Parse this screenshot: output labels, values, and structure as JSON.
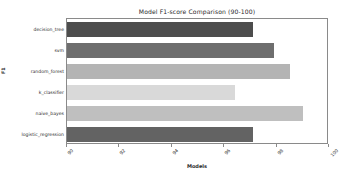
{
  "chart_data": {
    "type": "bar",
    "orientation": "horizontal",
    "title": "Model F1-score Comparison (90-100)",
    "xlabel": "Models",
    "ylabel": "F1",
    "categories": [
      "decision_tree",
      "svm",
      "random_forest",
      "k_classifier",
      "naive_bayes",
      "logistic_regression"
    ],
    "values": [
      97.1,
      97.9,
      98.5,
      96.4,
      99.0,
      97.1
    ],
    "bar_colors": [
      "#4d4d4d",
      "#6e6e6e",
      "#b4b4b4",
      "#d9d9d9",
      "#bfbfbf",
      "#636363"
    ],
    "xlim": [
      90,
      100
    ],
    "ylim": [
      0,
      6
    ],
    "xticks": [
      90,
      92,
      94,
      96,
      98,
      100
    ],
    "xtick_labels": [
      "90",
      "92",
      "94",
      "96",
      "98",
      "100"
    ],
    "grid": false,
    "legend": "none",
    "xtick_rotation": -45,
    "background": "#ffffff",
    "axis_color": "#8a8a8a"
  }
}
